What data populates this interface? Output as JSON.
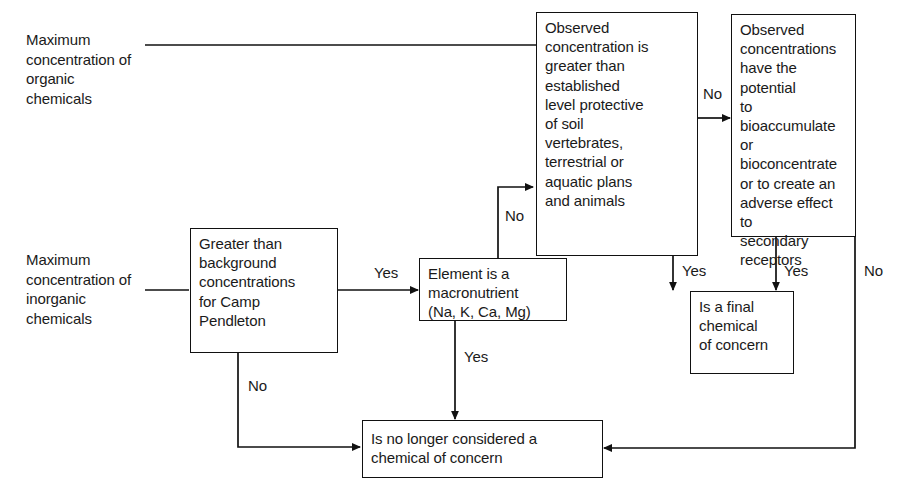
{
  "diagram": {
    "line_color": "#111111",
    "background": "#ffffff",
    "text_color": "#1a1a1a"
  },
  "inputs": [
    {
      "id": "organic-input",
      "text": "Maximum\nconcentration of\norganic\nchemicals"
    },
    {
      "id": "inorganic-input",
      "text": "Maximum\nconcentration of\ninorganic\nchemicals"
    }
  ],
  "nodes": [
    {
      "id": "background-check",
      "text": "Greater than\nbackground\nconcentrations\nfor Camp\nPendleton"
    },
    {
      "id": "macronutrient-check",
      "text": "Element is a\nmacronutrient\n(Na, K, Ca, Mg)"
    },
    {
      "id": "observed-concentration-check",
      "text": "Observed\nconcentration is\ngreater than\nestablished\nlevel protective\nof soil\nvertebrates,\nterrestrial or\naquatic plans\nand animals"
    },
    {
      "id": "bioaccumulate-check",
      "text": "Observed\nconcentrations\nhave the potential\nto bioaccumulate\nor bioconcentrate\nor to create an\nadverse effect to\nsecondary\nreceptors"
    },
    {
      "id": "final-chemical-of-concern",
      "text": "Is a final\nchemical\nof concern"
    },
    {
      "id": "no-longer-considered",
      "text": "Is no longer considered a\nchemical of concern"
    }
  ],
  "edge_labels": [
    {
      "id": "background-yes",
      "text": "Yes"
    },
    {
      "id": "background-no",
      "text": "No"
    },
    {
      "id": "macronutrient-no",
      "text": "No"
    },
    {
      "id": "macronutrient-yes",
      "text": "Yes"
    },
    {
      "id": "observed-no",
      "text": "No"
    },
    {
      "id": "observed-yes",
      "text": "Yes"
    },
    {
      "id": "bioaccumulate-yes",
      "text": "Yes"
    },
    {
      "id": "bioaccumulate-no",
      "text": "No"
    }
  ]
}
